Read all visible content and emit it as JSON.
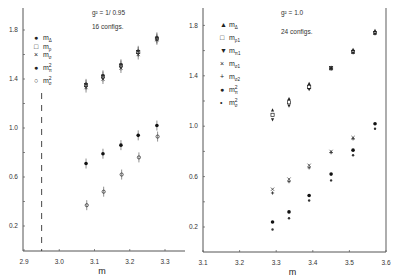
{
  "chart_data": [
    {
      "type": "scatter",
      "panel": "left",
      "title": "",
      "annotations": [
        "g^2 = 1/0.95",
        "16 configs."
      ],
      "xlabel": "m",
      "ylabel": "",
      "xlim": [
        2.9,
        3.35
      ],
      "ylim": [
        0.0,
        1.95
      ],
      "xticks": [
        "2.9",
        "3.0",
        "3.1",
        "3.2",
        "3.3"
      ],
      "yticks": [
        "0.2",
        "0.6",
        "1.0",
        "1.4",
        "1.8"
      ],
      "grid": false,
      "legend_position": "upper-left",
      "vertical_dashed_line_x": 2.95,
      "series": [
        {
          "name": "m_Δ",
          "marker": "filled-small",
          "x": [
            3.076,
            3.124,
            3.175,
            3.224,
            3.277
          ],
          "y": [
            1.36,
            1.43,
            1.52,
            1.63,
            1.74
          ]
        },
        {
          "name": "m_ρ",
          "marker": "open-square",
          "x": [
            3.076,
            3.124,
            3.175,
            3.224,
            3.277
          ],
          "y": [
            1.35,
            1.42,
            1.51,
            1.62,
            1.73
          ]
        },
        {
          "name": "m_σ",
          "marker": "cross",
          "x": [
            3.076,
            3.124,
            3.175,
            3.224,
            3.277
          ],
          "y": [
            1.33,
            1.4,
            1.49,
            1.6,
            1.72
          ]
        },
        {
          "name": "m_π²",
          "marker": "filled-circle",
          "x": [
            3.076,
            3.124,
            3.175,
            3.224,
            3.277
          ],
          "y": [
            0.71,
            0.79,
            0.86,
            0.94,
            1.02
          ]
        },
        {
          "name": "m_σ²",
          "marker": "open-circle",
          "x": [
            3.078,
            3.126,
            3.177,
            3.226,
            3.279
          ],
          "y": [
            0.37,
            0.48,
            0.62,
            0.76,
            0.93
          ]
        }
      ]
    },
    {
      "type": "scatter",
      "panel": "right",
      "title": "",
      "annotations": [
        "g^2 = 1.0",
        "24 configs."
      ],
      "xlabel": "m",
      "ylabel": "",
      "xlim": [
        3.1,
        3.6
      ],
      "ylim": [
        0.0,
        1.95
      ],
      "xticks": [
        "3.1",
        "3.2",
        "3.3",
        "3.4",
        "3.5",
        "3.6"
      ],
      "yticks": [
        "0.2",
        "0.6",
        "1.0",
        "1.4",
        "1.8"
      ],
      "grid": false,
      "legend_position": "upper-left",
      "series": [
        {
          "name": "m_Δ",
          "marker": "filled-triangle",
          "x": [
            3.29,
            3.335,
            3.39,
            3.45,
            3.51,
            3.57
          ],
          "y": [
            1.13,
            1.22,
            1.34,
            1.47,
            1.61,
            1.76
          ]
        },
        {
          "name": "m_ρ1",
          "marker": "open-square",
          "x": [
            3.29,
            3.335,
            3.39,
            3.45,
            3.51,
            3.57
          ],
          "y": [
            1.09,
            1.19,
            1.31,
            1.46,
            1.59,
            1.74
          ]
        },
        {
          "name": "m_π1",
          "marker": "inverted-triangle",
          "x": [
            3.29,
            3.335,
            3.39,
            3.45,
            3.51,
            3.57
          ],
          "y": [
            1.05,
            1.16,
            1.29,
            1.45,
            1.58,
            1.73
          ]
        },
        {
          "name": "m_σ1",
          "marker": "cross",
          "x": [
            3.29,
            3.335,
            3.39,
            3.45,
            3.51
          ],
          "y": [
            0.5,
            0.58,
            0.69,
            0.8,
            0.91
          ]
        },
        {
          "name": "m_σ2",
          "marker": "plus",
          "x": [
            3.29,
            3.335,
            3.39,
            3.45,
            3.51
          ],
          "y": [
            0.47,
            0.56,
            0.67,
            0.79,
            0.9
          ]
        },
        {
          "name": "m_π²",
          "marker": "filled-circle",
          "x": [
            3.29,
            3.335,
            3.39,
            3.45,
            3.51,
            3.57
          ],
          "y": [
            0.24,
            0.32,
            0.45,
            0.62,
            0.81,
            1.02
          ]
        },
        {
          "name": "m_σ²",
          "marker": "small-dot",
          "x": [
            3.29,
            3.335,
            3.39,
            3.45,
            3.51,
            3.57
          ],
          "y": [
            0.18,
            0.27,
            0.41,
            0.57,
            0.77,
            0.98
          ]
        }
      ]
    }
  ],
  "left_panel": {
    "annotation_line1": "g² = 1/ 0.95",
    "annotation_line2": "16 configs.",
    "xlabel": "m",
    "xticks": [
      "2.9",
      "3.0",
      "3.1",
      "3.2",
      "3.3"
    ],
    "yticks": [
      "0.2",
      "0.6",
      "1.0",
      "1.4",
      "1.8"
    ],
    "legend": [
      {
        "symbol": "●",
        "label": "m",
        "sub": "Δ",
        "sup": ""
      },
      {
        "symbol": "□",
        "label": "m",
        "sub": "ρ",
        "sup": ""
      },
      {
        "symbol": "×",
        "label": "m",
        "sub": "σ",
        "sup": ""
      },
      {
        "symbol": "●",
        "label": "m",
        "sub": "π",
        "sup": "2"
      },
      {
        "symbol": "○",
        "label": "m",
        "sub": "σ",
        "sup": "2"
      }
    ]
  },
  "right_panel": {
    "annotation_line1": "g² = 1.0",
    "annotation_line2": "24 configs.",
    "xlabel": "m",
    "xticks": [
      "3.1",
      "3.2",
      "3.3",
      "3.4",
      "3.5",
      "3.6"
    ],
    "yticks": [
      "0.2",
      "0.6",
      "1.0",
      "1.4",
      "1.8"
    ],
    "legend": [
      {
        "symbol": "▲",
        "label": "m",
        "sub": "Δ",
        "sup": ""
      },
      {
        "symbol": "□",
        "label": "m",
        "sub": "ρ1",
        "sup": ""
      },
      {
        "symbol": "▼",
        "label": "m",
        "sub": "π1",
        "sup": ""
      },
      {
        "symbol": "×",
        "label": "m",
        "sub": "σ1",
        "sup": ""
      },
      {
        "symbol": "+",
        "label": "m",
        "sub": "σ2",
        "sup": ""
      },
      {
        "symbol": "●",
        "label": "m",
        "sub": "π",
        "sup": "2"
      },
      {
        "symbol": "•",
        "label": "m",
        "sub": "σ",
        "sup": "2"
      }
    ]
  }
}
